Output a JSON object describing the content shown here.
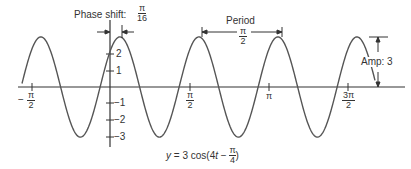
{
  "chart_data": {
    "type": "line",
    "title": "",
    "equation": "y = 3 cos(4t − π/4)",
    "xlabel": "t",
    "ylabel": "y",
    "x_ticks": [
      "−π/2",
      "π/2",
      "π",
      "3π/2"
    ],
    "y_ticks": [
      "2",
      "1",
      "−1",
      "−2",
      "−3"
    ],
    "xlim": [
      -1.65,
      5.9
    ],
    "ylim": [
      -3.2,
      3.2
    ],
    "amplitude": 3,
    "period": "π/2",
    "phase_shift": "π/16",
    "annotations": [
      "Phase shift: π/16",
      "Period π/2",
      "Amp: 3"
    ],
    "series": [
      {
        "name": "y = 3 cos(4t − π/4)",
        "function": "3*cos(4*t - pi/4)"
      }
    ]
  },
  "labels": {
    "phase_shift_text": "Phase shift:",
    "phase_shift_num": "π",
    "phase_shift_den": "16",
    "period_text": "Period",
    "period_num": "π",
    "period_den": "2",
    "amp_text": "Amp: 3",
    "tick_neg_pi2_num": "π",
    "tick_neg_pi2_den": "2",
    "tick_neg_sign": "−",
    "tick_pi2_num": "π",
    "tick_pi2_den": "2",
    "tick_pi": "π",
    "tick_3pi2_num": "3π",
    "tick_3pi2_den": "2",
    "y2": "2",
    "y1": "1",
    "ym1": "−1",
    "ym2": "−2",
    "ym3": "−3",
    "eq_prefix": "y = 3 cos(4",
    "eq_t": "t",
    "eq_minus": " − ",
    "eq_num": "π",
    "eq_den": "4",
    "eq_suffix": ")"
  }
}
